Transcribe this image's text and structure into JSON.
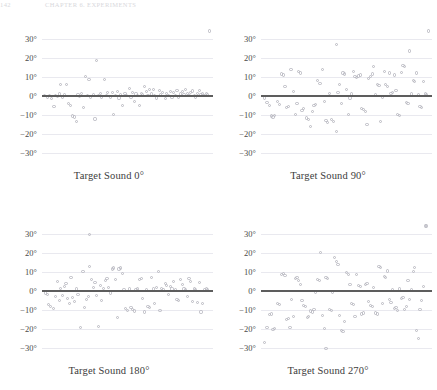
{
  "running_head": {
    "page_number": "142",
    "text": "CHAPTER 6. EXPERIMENTS"
  },
  "figure": {
    "marker_color": "#b9b9c2",
    "zero_line_color": "#5d5d5d",
    "gridline_color": "#e9e9ef"
  },
  "chart_data": [
    {
      "type": "scatter",
      "title": "Target Sound 0°",
      "xlabel": "",
      "ylabel": "",
      "ylim": [
        -34,
        34
      ],
      "xlim": [
        0,
        100
      ],
      "grid": true,
      "legend": null,
      "yticks": [
        30,
        20,
        10,
        0,
        -10,
        -20,
        -30
      ],
      "yticklabels": [
        "30°",
        "20°",
        "10°",
        "0°",
        "−10°",
        "−20°",
        "−30°"
      ],
      "reference_line": 0,
      "x": [
        1.5,
        3,
        4.5,
        5.5,
        7,
        8,
        9,
        10,
        11,
        12,
        13,
        14.5,
        15.5,
        16.5,
        18,
        19,
        20,
        21,
        22,
        23,
        24.5,
        25.5,
        26.5,
        27.5,
        28.5,
        30,
        31,
        32,
        33,
        34,
        35,
        36.5,
        37.5,
        38.5,
        40,
        41,
        42,
        43,
        44,
        45,
        46,
        47,
        48.5,
        49.5,
        51,
        52,
        53,
        54,
        55,
        56,
        57,
        58,
        59,
        60,
        61,
        62,
        63,
        64,
        65,
        66,
        67,
        68.5,
        69.5,
        70.5,
        72,
        73,
        74,
        75,
        76,
        77,
        78,
        79,
        80,
        81,
        82,
        83,
        84,
        85,
        86,
        87,
        88,
        89,
        90,
        91,
        92,
        93,
        94,
        95,
        96,
        97,
        98
      ],
      "y": [
        0.3,
        -0.5,
        0.2,
        -1.2,
        -5.5,
        0.4,
        -0.3,
        1.0,
        6.0,
        -0.6,
        0.5,
        6.0,
        -4.0,
        -5.0,
        -10.5,
        -11.0,
        -13.5,
        0.6,
        -0.4,
        1.2,
        -6.0,
        10.0,
        0.3,
        8.5,
        -0.8,
        0.5,
        -12.0,
        18.5,
        0.2,
        1.5,
        -0.5,
        8.5,
        0.4,
        2.0,
        -0.6,
        1.8,
        -9.5,
        0.3,
        2.5,
        -1.0,
        0.5,
        -5.0,
        1.2,
        0.4,
        3.8,
        -0.5,
        2.0,
        -3.0,
        1.0,
        0.2,
        -5.0,
        1.5,
        0.6,
        4.8,
        2.2,
        0.3,
        3.5,
        1.0,
        3.2,
        0.4,
        -1.0,
        2.8,
        0.5,
        2.0,
        -1.5,
        1.2,
        0.3,
        2.5,
        -0.6,
        1.8,
        0.4,
        3.0,
        -0.8,
        1.0,
        2.2,
        0.5,
        3.5,
        1.5,
        0.3,
        2.0,
        2.6,
        0.4,
        -0.5,
        1.2,
        2.8,
        0.6,
        1.0,
        0.3,
        1.5,
        0.8
      ]
    },
    {
      "type": "scatter",
      "title": "Target Sound 90°",
      "xlabel": "",
      "ylabel": "",
      "ylim": [
        -34,
        34
      ],
      "xlim": [
        0,
        100
      ],
      "grid": true,
      "legend": null,
      "yticks": [
        30,
        20,
        10,
        0,
        -10,
        -20,
        -30
      ],
      "yticklabels": [
        "30°",
        "20°",
        "10°",
        "0°",
        "−10°",
        "−20°",
        "−30°"
      ],
      "reference_line": 0,
      "x": [
        2,
        3.5,
        5,
        6,
        7,
        8,
        9.5,
        11,
        12,
        13,
        14,
        15,
        16,
        17.5,
        19,
        20,
        21,
        22,
        23,
        24,
        25,
        26.5,
        28,
        29,
        30,
        31,
        32,
        33,
        34.5,
        36,
        37,
        38,
        39,
        40,
        41,
        42.5,
        44,
        45,
        46,
        47,
        48,
        49,
        50,
        51,
        52,
        53,
        54,
        55,
        56,
        57,
        58,
        59,
        60,
        61,
        62,
        63,
        64,
        65,
        66,
        67,
        68,
        69,
        70,
        71,
        72,
        73,
        74,
        75,
        76,
        77,
        78,
        79,
        80,
        81,
        82,
        83,
        84,
        85,
        86,
        87,
        88,
        89,
        90,
        91,
        92,
        93,
        94,
        95,
        96,
        97,
        98
      ],
      "y": [
        -1.0,
        -3.5,
        -5.0,
        -10.5,
        -11.0,
        -10.0,
        -3.0,
        -4.5,
        11.5,
        11.0,
        5.0,
        -6.0,
        -5.5,
        14.0,
        2.5,
        -9.5,
        -4.0,
        13.0,
        12.0,
        -7.5,
        -6.5,
        -11.5,
        -12.5,
        -16.0,
        -8.0,
        -5.0,
        -4.5,
        8.0,
        6.5,
        14.0,
        -3.0,
        -13.0,
        -14.0,
        1.5,
        -12.5,
        -13.5,
        -18.5,
        2.0,
        6.0,
        -4.0,
        12.0,
        11.5,
        3.5,
        -9.5,
        -1.0,
        1.0,
        13.0,
        10.0,
        9.5,
        10.5,
        11.0,
        -6.5,
        -7.0,
        -8.0,
        -15.0,
        9.0,
        10.0,
        11.5,
        15.5,
        0.5,
        6.0,
        5.5,
        -13.5,
        -0.5,
        13.0,
        6.0,
        5.0,
        12.0,
        1.5,
        2.0,
        11.0,
        3.0,
        -9.5,
        -10.0,
        12.5,
        16.0,
        15.5,
        -3.5,
        -4.0,
        23.5,
        1.0,
        8.0,
        7.5,
        12.0,
        0.5,
        -5.5,
        -6.0,
        7.5,
        1.0,
        0.5
      ],
      "outliers": [
        {
          "x": 44,
          "y": 27.0
        }
      ]
    },
    {
      "type": "scatter",
      "title": "Target Sound 180°",
      "xlabel": "",
      "ylabel": "",
      "ylim": [
        -34,
        34
      ],
      "xlim": [
        0,
        100
      ],
      "grid": true,
      "legend": null,
      "yticks": [
        30,
        20,
        10,
        0,
        -10,
        -20,
        -30
      ],
      "yticklabels": [
        "30°",
        "20°",
        "10°",
        "0°",
        "−10°",
        "−20°",
        "−30°"
      ],
      "reference_line": 0,
      "x": [
        2,
        3,
        4,
        5,
        6.5,
        8,
        9,
        10,
        11,
        12,
        13,
        14,
        15,
        16,
        17,
        18,
        19,
        20,
        21,
        22.5,
        24,
        25,
        26,
        27,
        28,
        29,
        30,
        31,
        32,
        33,
        34,
        35,
        36,
        37,
        38,
        39,
        40,
        41,
        42,
        43,
        44,
        45,
        46,
        47,
        48,
        49,
        50,
        51,
        52,
        53,
        54,
        55,
        56,
        57,
        58,
        59,
        60,
        61,
        62,
        63,
        64,
        65,
        66,
        67,
        68,
        69,
        70,
        71,
        72,
        73,
        74,
        75,
        76,
        77,
        78,
        79,
        80,
        81,
        82,
        83,
        84,
        85,
        86,
        87,
        88,
        89,
        90,
        91,
        92,
        93,
        94,
        95,
        96,
        97
      ],
      "y": [
        -1.0,
        -2.0,
        -7.0,
        -8.0,
        -9.0,
        -3.0,
        5.0,
        -5.0,
        1.5,
        -2.5,
        2.5,
        4.0,
        -4.0,
        -6.5,
        7.0,
        -3.5,
        -5.5,
        1.0,
        -2.0,
        -19.0,
        10.0,
        -8.5,
        -4.5,
        -3.0,
        13.0,
        6.0,
        2.0,
        4.5,
        -2.5,
        -18.5,
        3.0,
        -5.0,
        1.5,
        5.5,
        6.5,
        2.0,
        -1.0,
        11.5,
        12.0,
        6.0,
        -14.0,
        11.5,
        12.0,
        9.0,
        0.5,
        -9.0,
        -10.0,
        1.0,
        -8.5,
        -9.5,
        -10.5,
        0.5,
        1.0,
        6.0,
        6.5,
        -4.0,
        -11.0,
        0.5,
        -8.0,
        -8.5,
        7.0,
        1.0,
        -6.5,
        2.0,
        10.0,
        -10.0,
        1.5,
        0.5,
        4.0,
        3.0,
        -2.0,
        2.5,
        1.0,
        5.0,
        0.5,
        -4.5,
        -5.0,
        6.0,
        3.5,
        1.0,
        0.5,
        -3.0,
        6.5,
        5.0,
        -5.5,
        1.0,
        0.5,
        -6.0,
        4.5,
        -11.0,
        -6.5,
        0.5,
        1.0,
        0.5
      ],
      "outliers": [
        {
          "x": 28,
          "y": 29.5
        }
      ]
    },
    {
      "type": "scatter",
      "title": "Target Sound 270°",
      "xlabel": "",
      "ylabel": "",
      "ylim": [
        -34,
        34
      ],
      "xlim": [
        0,
        100
      ],
      "grid": true,
      "legend": null,
      "yticks": [
        30,
        20,
        10,
        0,
        -10,
        -20,
        -30
      ],
      "yticklabels": [
        "30°",
        "20°",
        "10°",
        "0°",
        "−10°",
        "−20°",
        "−30°"
      ],
      "reference_line": 0,
      "x": [
        2,
        3.5,
        5,
        6,
        7,
        8,
        9.5,
        11,
        12,
        13,
        14,
        15,
        16,
        17,
        18,
        19,
        20,
        21,
        22,
        23,
        24,
        25,
        26,
        27,
        28,
        29,
        30,
        31,
        32,
        33,
        34,
        35,
        36,
        37,
        38,
        39,
        40,
        41,
        42,
        43,
        44,
        45,
        46,
        47,
        48,
        49,
        50,
        51,
        52,
        53,
        54,
        55,
        56,
        57,
        58,
        59,
        60,
        61,
        62,
        63,
        64,
        65,
        66,
        67,
        68,
        69,
        70,
        71,
        72,
        73,
        74,
        75,
        76,
        77,
        78,
        79,
        80,
        81,
        82,
        83,
        84,
        85,
        86,
        87,
        88,
        89,
        90,
        91,
        92,
        93,
        94,
        95,
        96,
        97
      ],
      "y": [
        -27.0,
        -19.0,
        -12.5,
        -12.0,
        -20.0,
        -19.5,
        -6.5,
        -7.0,
        8.5,
        9.0,
        8.0,
        -15.0,
        -14.5,
        -19.0,
        -4.5,
        -13.5,
        6.5,
        7.0,
        5.5,
        3.5,
        -5.0,
        -7.5,
        -8.0,
        -14.0,
        -13.5,
        -10.5,
        -11.0,
        -9.5,
        -0.5,
        6.0,
        5.5,
        20.0,
        -13.0,
        -19.5,
        7.0,
        6.5,
        -9.5,
        -10.0,
        -0.5,
        17.5,
        15.5,
        14.0,
        -13.0,
        -20.5,
        -21.0,
        -16.0,
        9.5,
        8.5,
        3.5,
        -6.5,
        -7.0,
        -13.5,
        8.5,
        3.0,
        2.5,
        -12.0,
        -11.5,
        3.5,
        4.0,
        -5.5,
        -7.5,
        -8.0,
        2.0,
        -11.5,
        -12.0,
        13.0,
        12.5,
        -6.5,
        7.5,
        7.0,
        10.5,
        -4.5,
        -6.0,
        0.5,
        -9.0,
        -8.5,
        -10.0,
        1.0,
        -4.0,
        -3.5,
        -9.5,
        -8.0,
        5.5,
        -4.5,
        0.5,
        10.0,
        12.5,
        -20.5,
        -25.0,
        -9.5,
        -5.0,
        2.5
      ],
      "outliers": [
        {
          "x": 38,
          "y": -30.0
        }
      ]
    }
  ]
}
